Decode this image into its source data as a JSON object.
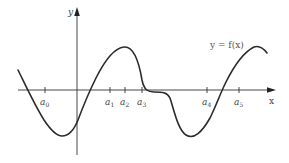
{
  "figure": {
    "axes": {
      "x_label": "x",
      "y_label": "y"
    },
    "function_label": "y = f(x)",
    "ticks": [
      {
        "base": "a",
        "sub": "0",
        "x": 45
      },
      {
        "base": "a",
        "sub": "1",
        "x": 110
      },
      {
        "base": "a",
        "sub": "2",
        "x": 125
      },
      {
        "base": "a",
        "sub": "3",
        "x": 142
      },
      {
        "base": "a",
        "sub": "4",
        "x": 207
      },
      {
        "base": "a",
        "sub": "5",
        "x": 239
      }
    ],
    "colors": {
      "curve": "#2b2b2b",
      "axis": "#333333",
      "text": "#444444",
      "background": "#ffffff"
    }
  }
}
